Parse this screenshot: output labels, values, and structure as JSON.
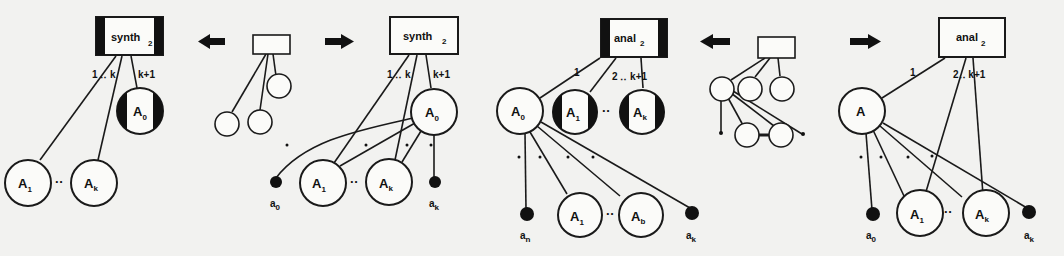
{
  "figure": {
    "panels": [
      {
        "id": "synth-before",
        "box_label": "synth",
        "box_sub": "2",
        "edge_labels": [
          "1 ‥ k",
          "k+1"
        ],
        "nodes": [
          "A1",
          "Ak",
          "A0"
        ]
      },
      {
        "id": "synth-pattern",
        "description": "small tree pattern with arrows"
      },
      {
        "id": "synth-after",
        "box_label": "synth",
        "box_sub": "2",
        "edge_labels": [
          "1 ‥ k",
          "k+1"
        ],
        "nodes": [
          "A0",
          "A1",
          "Ak"
        ],
        "leaves": [
          "a0",
          "ak"
        ]
      },
      {
        "id": "anal-before",
        "box_label": "anal",
        "box_sub": "2",
        "edge_labels": [
          "1",
          "2 ‥ k+1"
        ],
        "nodes": [
          "A0",
          "A1",
          "Ak",
          "A1",
          "Ak"
        ],
        "leaves": [
          "an",
          "ak"
        ]
      },
      {
        "id": "anal-pattern",
        "description": "small tree pattern with arrows"
      },
      {
        "id": "anal-after",
        "box_label": "anal",
        "box_sub": "2",
        "edge_labels": [
          "1",
          "2‥ k+1"
        ],
        "nodes": [
          "A",
          "A1",
          "Ak"
        ],
        "leaves": [
          "a0",
          "ak"
        ]
      }
    ],
    "labels": {
      "synth": "synth",
      "anal": "anal",
      "sub2": "2",
      "one_dots_k": "1 ‥ k",
      "k1": "k+1",
      "one": "1",
      "two_dots_k1": "2 ‥ k+1",
      "two_dots_k1b": "2‥ k+1",
      "A": "A",
      "A0": "A",
      "A1": "A",
      "Ak": "A",
      "s0": "0",
      "s1": "1",
      "sk": "k",
      "sb": "b",
      "a": "a",
      "n": "n",
      "dots": "··"
    }
  }
}
